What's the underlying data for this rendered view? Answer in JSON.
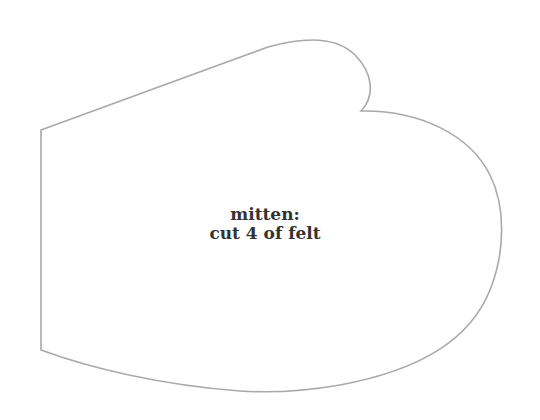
{
  "pattern": {
    "piece_name": "mitten:",
    "instruction": "cut 4 of felt",
    "outline_color": "#a9a9a9",
    "text_color": "#333333"
  }
}
